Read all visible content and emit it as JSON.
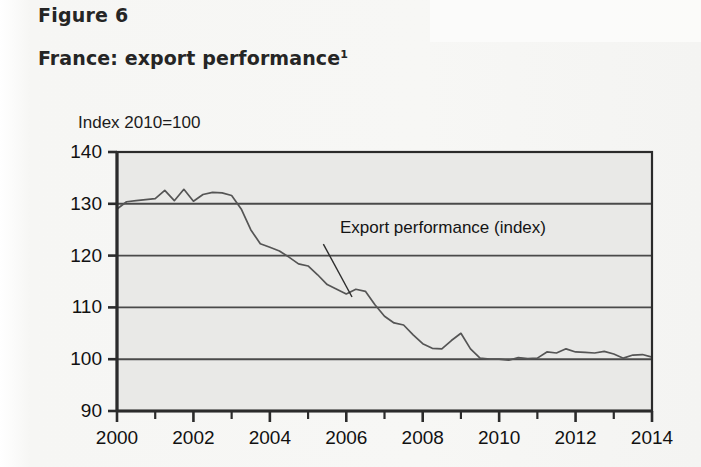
{
  "figure": {
    "label": "Figure 6",
    "title": "France: export performance",
    "title_footnote_marker": "1"
  },
  "chart_data": {
    "type": "line",
    "title": "France: export performance",
    "subtitle": "Index 2010=100",
    "xlabel": "",
    "ylabel": "Index 2010=100",
    "unit_note": "Index 2010=100",
    "xlim": [
      2000,
      2014
    ],
    "ylim": [
      90,
      140
    ],
    "y_ticks": [
      90,
      100,
      110,
      120,
      130,
      140
    ],
    "x_ticks": [
      2000,
      2002,
      2004,
      2006,
      2008,
      2010,
      2012,
      2014
    ],
    "x_minor_ticks": [
      2001,
      2003,
      2005,
      2007,
      2009,
      2011,
      2013
    ],
    "grid": "horizontal",
    "legend": "none",
    "annotations": [
      {
        "text": "Export performance (index)",
        "x": 2005.4,
        "y": 123.0,
        "pointer_to_x": 2006.15,
        "pointer_to_y": 112.0
      }
    ],
    "series": [
      {
        "name": "Export performance (index)",
        "color": "#555555",
        "x": [
          2000.0,
          2000.25,
          2000.5,
          2000.75,
          2001.0,
          2001.25,
          2001.5,
          2001.75,
          2002.0,
          2002.25,
          2002.5,
          2002.75,
          2003.0,
          2003.25,
          2003.5,
          2003.75,
          2004.0,
          2004.25,
          2004.5,
          2004.75,
          2005.0,
          2005.25,
          2005.5,
          2005.75,
          2006.0,
          2006.25,
          2006.5,
          2006.75,
          2007.0,
          2007.25,
          2007.5,
          2007.75,
          2008.0,
          2008.25,
          2008.5,
          2008.75,
          2009.0,
          2009.25,
          2009.5,
          2009.75,
          2010.0,
          2010.25,
          2010.5,
          2010.75,
          2011.0,
          2011.25,
          2011.5,
          2011.75,
          2012.0,
          2012.25,
          2012.5,
          2012.75,
          2013.0,
          2013.25,
          2013.5,
          2013.75,
          2014.0
        ],
        "values": [
          129.0,
          130.4,
          130.6,
          130.8,
          131.0,
          132.6,
          130.6,
          132.8,
          130.5,
          131.8,
          132.2,
          132.1,
          131.6,
          129.0,
          125.0,
          122.3,
          121.6,
          120.9,
          119.7,
          118.4,
          118.0,
          116.3,
          114.4,
          113.5,
          112.6,
          113.5,
          113.1,
          110.5,
          108.3,
          107.0,
          106.6,
          104.7,
          103.0,
          102.1,
          102.0,
          103.6,
          105.0,
          102.0,
          100.2,
          100.0,
          100.0,
          99.8,
          100.3,
          100.1,
          100.2,
          101.4,
          101.2,
          102.0,
          101.4,
          101.3,
          101.2,
          101.5,
          101.0,
          100.2,
          100.8,
          100.9,
          100.4
        ]
      }
    ]
  },
  "colors": {
    "plot_background": "#e9e9e7",
    "page_background": "#f7f7f5",
    "axis": "#2b2b2b",
    "gridline": "#4a4a4a",
    "series": "#585858",
    "text": "#161616"
  }
}
